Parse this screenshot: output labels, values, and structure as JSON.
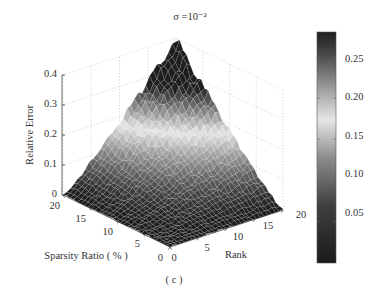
{
  "chart_data": {
    "type": "surface3d",
    "title": "σ =10⁻²",
    "caption": "( c )",
    "xlabel": "Rank",
    "ylabel": "Sparsity Ratio ( % )",
    "zlabel": "Relative Error",
    "xlim": [
      0,
      20
    ],
    "ylim": [
      0,
      20
    ],
    "zlim": [
      0,
      0.4
    ],
    "x_ticks": [
      "0",
      "5",
      "10",
      "15",
      "20"
    ],
    "y_ticks": [
      "0",
      "5",
      "10",
      "15",
      "20"
    ],
    "z_ticks": [
      "0",
      "0.1",
      "0.2",
      "0.3",
      "0.4"
    ],
    "grid": true,
    "colorbar": {
      "range": [
        0,
        0.28
      ],
      "ticks": [
        "0.05",
        "0.10",
        "0.15",
        "0.20",
        "0.25"
      ],
      "colormap": "dark-light-dark (gray)"
    },
    "surface_description": "Error is ~0 for low rank or low sparsity, rising roughly with both rank and sparsity ratio to a peak of ~0.4 at rank 20, sparsity 20",
    "surface_model": {
      "peak": 0.4,
      "at_rank": 20,
      "at_sparsity": 20,
      "noise": 0.02
    }
  }
}
